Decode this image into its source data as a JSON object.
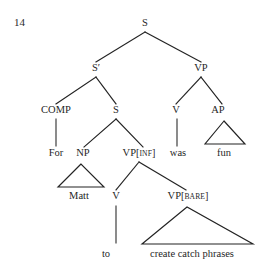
{
  "figure": {
    "example_number": "14",
    "kind": "syntax-tree",
    "ink_color": "#232323",
    "background_color": "#ffffff",
    "caption": ""
  },
  "nodes": {
    "root_s": {
      "label": "S",
      "x": 145,
      "y": 26
    },
    "s_bar": {
      "label": "S′",
      "x": 96,
      "y": 71
    },
    "vp_top": {
      "label": "VP",
      "x": 201,
      "y": 71
    },
    "comp": {
      "label": "COMP",
      "x": 56,
      "y": 113
    },
    "s_embedded": {
      "label": "S",
      "x": 116,
      "y": 113
    },
    "v_was": {
      "label": "V",
      "x": 176,
      "y": 113
    },
    "ap": {
      "label": "AP",
      "x": 218,
      "y": 113
    },
    "np": {
      "label": "NP",
      "x": 83,
      "y": 156
    },
    "vp_inf": {
      "label": "VP",
      "feature": "INF",
      "x": 139,
      "y": 156
    },
    "v_to": {
      "label": "V",
      "x": 116,
      "y": 199
    },
    "vp_bare": {
      "label": "VP",
      "feature": "BARE",
      "x": 188,
      "y": 199
    }
  },
  "terminals": {
    "for": {
      "text": "For",
      "x": 56,
      "y": 156
    },
    "was": {
      "text": "was",
      "x": 178,
      "y": 156
    },
    "fun": {
      "text": "fun",
      "x": 224,
      "y": 156
    },
    "matt": {
      "text": "Matt",
      "x": 79,
      "y": 199
    },
    "to": {
      "text": "to",
      "x": 106,
      "y": 257
    },
    "create_catch_phrases": {
      "text": "create catch phrases",
      "x": 192,
      "y": 257
    }
  },
  "structure": {
    "description": "S -> S' VP ; S' -> COMP S ; COMP -> For ; S -> NP VP[INF] ; NP -> Matt ; VP[INF] -> V VP[BARE] ; V -> to ; VP[BARE] -> create catch phrases ; VP -> V AP ; V -> was ; AP -> fun",
    "branches": [
      {
        "name": "s-to-sbar",
        "x1": 145,
        "y1": 32,
        "x2": 96,
        "y2": 62
      },
      {
        "name": "s-to-vp",
        "x1": 145,
        "y1": 32,
        "x2": 201,
        "y2": 62
      },
      {
        "name": "sbar-to-comp",
        "x1": 96,
        "y1": 77,
        "x2": 56,
        "y2": 104
      },
      {
        "name": "sbar-to-s",
        "x1": 96,
        "y1": 77,
        "x2": 116,
        "y2": 104
      },
      {
        "name": "vp-to-v",
        "x1": 201,
        "y1": 77,
        "x2": 176,
        "y2": 104
      },
      {
        "name": "vp-to-ap",
        "x1": 201,
        "y1": 77,
        "x2": 222,
        "y2": 104
      },
      {
        "name": "comp-to-for",
        "x1": 56,
        "y1": 119,
        "x2": 56,
        "y2": 146
      },
      {
        "name": "s-to-np",
        "x1": 116,
        "y1": 119,
        "x2": 84,
        "y2": 147
      },
      {
        "name": "s-to-vpinf",
        "x1": 116,
        "y1": 119,
        "x2": 143,
        "y2": 147
      },
      {
        "name": "v-to-was",
        "x1": 177,
        "y1": 119,
        "x2": 177,
        "y2": 146
      },
      {
        "name": "vpinf-to-v",
        "x1": 139,
        "y1": 162,
        "x2": 116,
        "y2": 190
      },
      {
        "name": "vpinf-to-vpbare",
        "x1": 139,
        "y1": 162,
        "x2": 186,
        "y2": 190
      },
      {
        "name": "v-to-to",
        "x1": 116,
        "y1": 206,
        "x2": 116,
        "y2": 243
      }
    ],
    "triangles": [
      {
        "name": "ap-triangle",
        "apex_x": 224,
        "apex_y": 121,
        "left_x": 205,
        "left_y": 144,
        "right_x": 245,
        "right_y": 144
      },
      {
        "name": "np-triangle",
        "apex_x": 81,
        "apex_y": 164,
        "left_x": 58,
        "left_y": 187,
        "right_x": 104,
        "right_y": 187
      },
      {
        "name": "vpbare-triangle",
        "apex_x": 187,
        "apex_y": 207,
        "left_x": 142,
        "left_y": 244,
        "right_x": 253,
        "right_y": 244
      }
    ]
  }
}
